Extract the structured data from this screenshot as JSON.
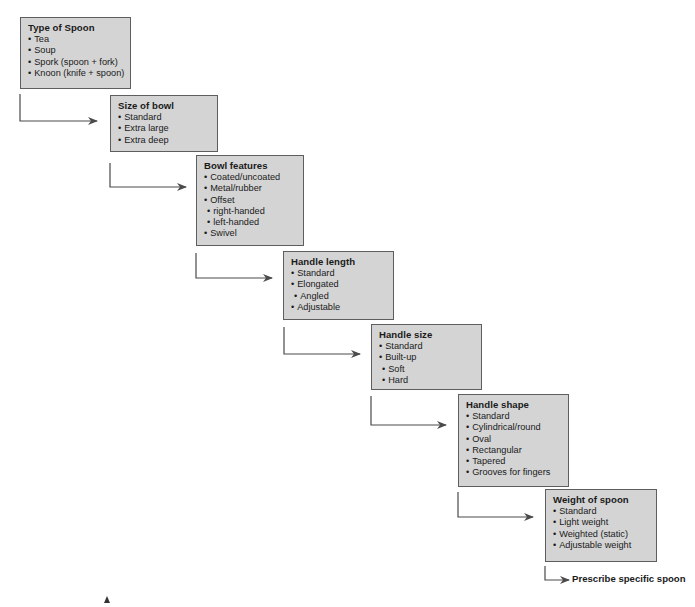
{
  "diagram": {
    "type": "sequential-flow",
    "steps": [
      {
        "title": "Type of Spoon",
        "items": [
          {
            "text": "Tea",
            "sub": false
          },
          {
            "text": "Soup",
            "sub": false
          },
          {
            "text": "Spork (spoon + fork)",
            "sub": false
          },
          {
            "text": "Knoon (knife + spoon)",
            "sub": false
          }
        ]
      },
      {
        "title": "Size of bowl",
        "items": [
          {
            "text": "Standard",
            "sub": false
          },
          {
            "text": "Extra large",
            "sub": false
          },
          {
            "text": "Extra deep",
            "sub": false
          }
        ]
      },
      {
        "title": "Bowl features",
        "items": [
          {
            "text": "Coated/uncoated",
            "sub": false
          },
          {
            "text": "Metal/rubber",
            "sub": false
          },
          {
            "text": "Offset",
            "sub": false
          },
          {
            "text": "right-handed",
            "sub": true
          },
          {
            "text": "left-handed",
            "sub": true
          },
          {
            "text": "Swivel",
            "sub": false
          }
        ]
      },
      {
        "title": "Handle length",
        "items": [
          {
            "text": "Standard",
            "sub": false
          },
          {
            "text": "Elongated",
            "sub": false
          },
          {
            "text": "Angled",
            "sub": true
          },
          {
            "text": "Adjustable",
            "sub": false
          }
        ]
      },
      {
        "title": "Handle size",
        "items": [
          {
            "text": "Standard",
            "sub": false
          },
          {
            "text": "Built-up",
            "sub": false
          },
          {
            "text": "Soft",
            "sub": true
          },
          {
            "text": "Hard",
            "sub": true
          }
        ]
      },
      {
        "title": "Handle shape",
        "items": [
          {
            "text": "Standard",
            "sub": false
          },
          {
            "text": "Cylindrical/round",
            "sub": false
          },
          {
            "text": "Oval",
            "sub": false
          },
          {
            "text": "Rectangular",
            "sub": false
          },
          {
            "text": "Tapered",
            "sub": false
          },
          {
            "text": "Grooves for fingers",
            "sub": false
          }
        ]
      },
      {
        "title": "Weight of spoon",
        "items": [
          {
            "text": "Standard",
            "sub": false
          },
          {
            "text": "Light weight",
            "sub": false
          },
          {
            "text": "Weighted (static)",
            "sub": false
          },
          {
            "text": "Adjustable weight",
            "sub": false
          }
        ]
      }
    ],
    "final_outcome": "Prescribe specific spoon",
    "colors": {
      "box_fill": "#d4d4d4",
      "box_border": "#5e5e5e",
      "connector": "#4a4a4a",
      "text": "#1a1a1a"
    }
  }
}
